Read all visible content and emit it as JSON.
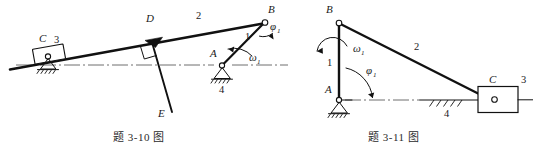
{
  "figure": {
    "background_color": "#ffffff",
    "ink_color": "#111111",
    "captions": {
      "left": "题 3-10 图",
      "right": "题 3-11 图"
    }
  },
  "left_mechanism": {
    "name": "题 3-10 图",
    "description": "Slider-crank / oscillating mechanism with rigid bent link D-E",
    "labels": {
      "joint_c": "C",
      "link_3": "3",
      "joint_d": "D",
      "link_2": "2",
      "joint_b": "B",
      "link_1": "1",
      "joint_a": "A",
      "link_4": "4",
      "point_e": "E",
      "omega": "ω",
      "omega_sub": "1",
      "phi": "φ",
      "phi_sub": "1"
    },
    "geometry": {
      "point_a": [
        222,
        65
      ],
      "point_b": [
        264,
        22
      ],
      "point_c": [
        47,
        55
      ],
      "point_d": [
        152,
        43
      ],
      "point_e": [
        172,
        112
      ],
      "slope_line_start": [
        10,
        68
      ],
      "slope_line_end": [
        268,
        23
      ],
      "centerline_y": 65
    }
  },
  "right_mechanism": {
    "name": "题 3-11 图",
    "description": "Crank-slider mechanism, vertical crank AB with connecting rod BC to slider at C",
    "labels": {
      "joint_b": "B",
      "link_1": "1",
      "link_2": "2",
      "joint_a": "A",
      "joint_c": "C",
      "link_3": "3",
      "link_4": "4",
      "omega": "ω",
      "omega_sub": "1",
      "phi": "φ",
      "phi_sub": "1"
    },
    "geometry": {
      "point_a": [
        339,
        100
      ],
      "point_b": [
        339,
        23
      ],
      "point_c": [
        490,
        100
      ],
      "slider_box": [
        478,
        87,
        40,
        26
      ],
      "centerline_y": 100,
      "rod_3_end": [
        533,
        100
      ]
    }
  }
}
